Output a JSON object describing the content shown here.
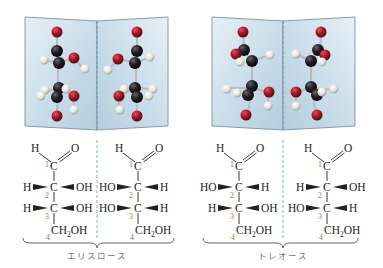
{
  "figure": {
    "groups": [
      {
        "label": "エリスロース",
        "models": [
          {
            "name": "left-enantiomer-model"
          },
          {
            "name": "right-enantiomer-model"
          }
        ],
        "fischer": [
          {
            "top_h": "H",
            "top_o": "O",
            "c1": "C",
            "n1": "1",
            "c2_left": "H",
            "c2": "C",
            "c2_right": "OH",
            "n2": "2",
            "c3_left": "H",
            "c3": "C",
            "c3_right": "OH",
            "n3": "3",
            "c4": "CH",
            "c4_sub": "2",
            "c4_tail": "OH",
            "n4": "4"
          },
          {
            "top_h": "H",
            "top_o": "O",
            "c1": "C",
            "n1": "1",
            "c2_left": "HO",
            "c2": "C",
            "c2_right": "H",
            "n2": "2",
            "c3_left": "HO",
            "c3": "C",
            "c3_right": "H",
            "n3": "3",
            "c4": "CH",
            "c4_sub": "2",
            "c4_tail": "OH",
            "n4": "4"
          }
        ]
      },
      {
        "label": "トレオース",
        "models": [
          {
            "name": "left-enantiomer-model"
          },
          {
            "name": "right-enantiomer-model"
          }
        ],
        "fischer": [
          {
            "top_h": "H",
            "top_o": "O",
            "c1": "C",
            "n1": "1",
            "c2_left": "HO",
            "c2": "C",
            "c2_right": "H",
            "n2": "2",
            "c3_left": "H",
            "c3": "C",
            "c3_right": "OH",
            "n3": "3",
            "c4": "CH",
            "c4_sub": "2",
            "c4_tail": "OH",
            "n4": "4"
          },
          {
            "top_h": "H",
            "top_o": "O",
            "c1": "C",
            "n1": "1",
            "c2_left": "H",
            "c2": "C",
            "c2_right": "OH",
            "n2": "2",
            "c3_left": "HO",
            "c3": "C",
            "c3_right": "H",
            "n3": "3",
            "c4": "CH",
            "c4_sub": "2",
            "c4_tail": "OH",
            "n4": "4"
          }
        ]
      }
    ],
    "colors": {
      "carbon": "#1e1a1e",
      "oxygen": "#a8182a",
      "hydrogen": "#e8e8e4",
      "mirror": "#cfe0ec",
      "mirror_line": "#5a9ccc",
      "locant": "#c8603a"
    }
  }
}
